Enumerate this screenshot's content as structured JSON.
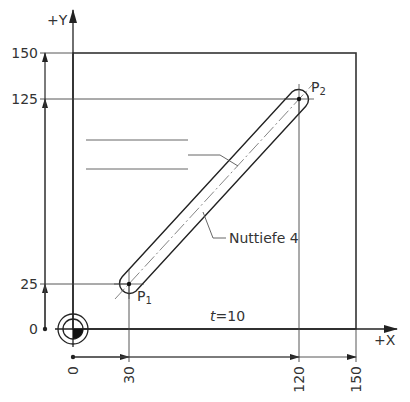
{
  "drawing": {
    "axis_x_label": "+X",
    "axis_y_label": "+Y",
    "y_ticks": [
      {
        "label": "150",
        "value": 150
      },
      {
        "label": "125",
        "value": 125
      },
      {
        "label": "25",
        "value": 25
      },
      {
        "label": "0",
        "value": 0
      }
    ],
    "x_ticks": [
      {
        "label": "0",
        "value": 0
      },
      {
        "label": "30",
        "value": 30
      },
      {
        "label": "120",
        "value": 120
      },
      {
        "label": "150",
        "value": 150
      }
    ],
    "points": {
      "p1": {
        "label": "P",
        "sub": "1",
        "x": 30,
        "y": 25
      },
      "p2": {
        "label": "P",
        "sub": "2",
        "x": 120,
        "y": 125
      }
    },
    "slot_note": "Nuttiefe 4",
    "thickness_label": "t",
    "thickness_value": "=10",
    "colors": {
      "line": "#333333",
      "thin": "#555555",
      "background": "#ffffff"
    }
  }
}
